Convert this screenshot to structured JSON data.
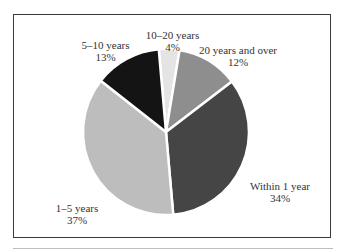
{
  "chart_data": {
    "type": "pie",
    "title": "",
    "categories": [
      "10–20 years",
      "20 years and over",
      "Within 1 year",
      "1–5 years",
      "5–10 years"
    ],
    "values": [
      4,
      12,
      34,
      37,
      13
    ],
    "unit": "%",
    "start_angle_deg": -5,
    "direction": "clockwise",
    "colors": [
      "#e4e4e4",
      "#8e8e8e",
      "#454545",
      "#bdbdbd",
      "#141414"
    ],
    "legend": "none (direct labels)",
    "labels": [
      {
        "name": "10–20 years",
        "pct": "4%"
      },
      {
        "name": "20 years and over",
        "pct": "12%"
      },
      {
        "name": "Within 1 year",
        "pct": "34%"
      },
      {
        "name": "1–5 years",
        "pct": "37%"
      },
      {
        "name": "5–10 years",
        "pct": "13%"
      }
    ]
  }
}
